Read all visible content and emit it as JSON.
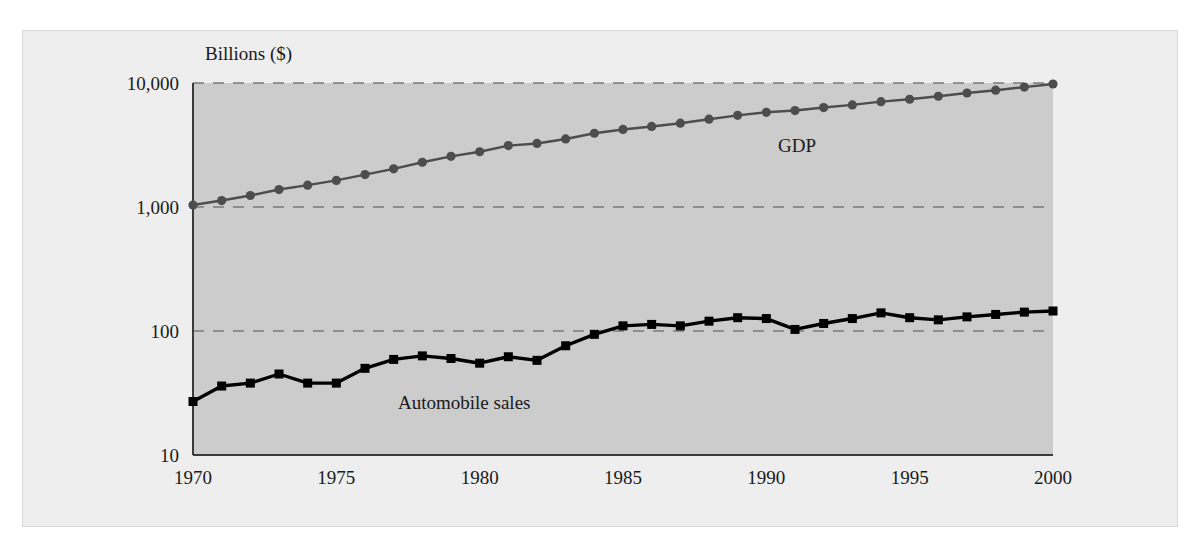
{
  "figure": {
    "background_color": "#ffffff",
    "panel_color": "#eeeeee",
    "plot_area_color": "#cccccc",
    "axis_color": "#3a3a3a",
    "gridline_color": "#7a7a7a"
  },
  "axes": {
    "y_unit_label": "Billions ($)",
    "y_ticks": [
      "10,000",
      "1,000",
      "100",
      "10"
    ],
    "y_tick_values": [
      10000,
      1000,
      100,
      10
    ],
    "x_ticks": [
      "1970",
      "1975",
      "1980",
      "1985",
      "1990",
      "1995",
      "2000"
    ],
    "x_tick_values": [
      1970,
      1975,
      1980,
      1985,
      1990,
      1995,
      2000
    ]
  },
  "series_labels": {
    "gdp": "GDP",
    "automobile_sales": "Automobile sales"
  },
  "chart_data": {
    "type": "line",
    "title": "",
    "subtitle": "",
    "xlabel": "",
    "ylabel": "Billions ($)",
    "yscale": "log",
    "ylim": [
      10,
      10000
    ],
    "xlim": [
      1970,
      2000
    ],
    "grid": true,
    "grid_style": "dashed horizontal gridlines at 10,000 / 1,000 / 100",
    "legend": "inline labels placed next to each series",
    "x": [
      1970,
      1971,
      1972,
      1973,
      1974,
      1975,
      1976,
      1977,
      1978,
      1979,
      1980,
      1981,
      1982,
      1983,
      1984,
      1985,
      1986,
      1987,
      1988,
      1989,
      1990,
      1991,
      1992,
      1993,
      1994,
      1995,
      1996,
      1997,
      1998,
      1999,
      2000
    ],
    "series": [
      {
        "name": "GDP",
        "color": "#4d4d4d",
        "marker": "circle",
        "values": [
          1038,
          1127,
          1238,
          1383,
          1500,
          1638,
          1825,
          2031,
          2295,
          2563,
          2790,
          3128,
          3255,
          3537,
          3933,
          4220,
          4463,
          4740,
          5104,
          5484,
          5803,
          5996,
          6338,
          6657,
          7072,
          7398,
          7817,
          8304,
          8747,
          9268,
          9817
        ]
      },
      {
        "name": "Automobile sales",
        "color": "#000000",
        "marker": "square",
        "values": [
          27,
          36,
          38,
          45,
          38,
          38,
          50,
          59,
          63,
          60,
          55,
          62,
          58,
          76,
          94,
          110,
          113,
          110,
          120,
          128,
          126,
          103,
          115,
          126,
          140,
          128,
          123,
          130,
          136,
          142,
          145
        ]
      }
    ],
    "annotations": [
      {
        "text": "GDP",
        "x": 1993,
        "y": 2200
      },
      {
        "text": "Automobile sales",
        "x": 1981,
        "y": 35
      }
    ]
  }
}
